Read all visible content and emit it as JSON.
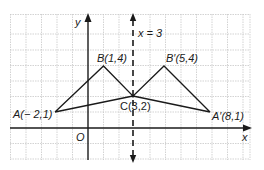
{
  "diagram": {
    "type": "coordinate-plane-reflection",
    "axes": {
      "x_label": "x",
      "y_label": "y",
      "origin_label": "O"
    },
    "line_of_reflection": {
      "label": "x = 3",
      "style": "dashed"
    },
    "points": [
      {
        "name": "A",
        "label": "A(− 2,1)",
        "x": -2,
        "y": 1
      },
      {
        "name": "B",
        "label": "B(1,4)",
        "x": 1,
        "y": 4
      },
      {
        "name": "C",
        "label": "C(3,2)",
        "x": 3,
        "y": 2
      },
      {
        "name": "B'",
        "label": "B′(5,4)",
        "x": 5,
        "y": 4
      },
      {
        "name": "A'",
        "label": "A′(8,1)",
        "x": 8,
        "y": 1
      }
    ],
    "colors": {
      "grid": "#c8c8c8",
      "lines": "#1a1a1a",
      "background": "#ffffff"
    }
  }
}
